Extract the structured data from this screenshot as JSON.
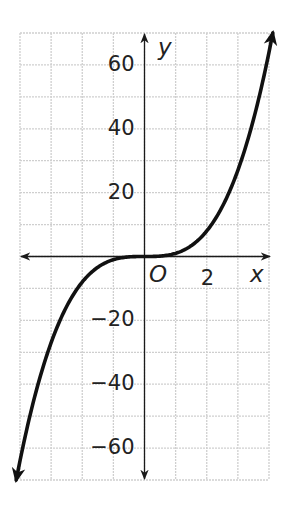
{
  "chart_data": {
    "type": "line",
    "title": "",
    "function": "y = x^3",
    "xlabel": "x",
    "ylabel": "y",
    "origin_label": "O",
    "xlim": [
      -4,
      4
    ],
    "ylim": [
      -70,
      70
    ],
    "x_grid_step": 1,
    "y_grid_step": 10,
    "grid": true,
    "x_tick_labels": [
      {
        "value": 2,
        "label": "2"
      }
    ],
    "y_tick_labels": [
      {
        "value": 60,
        "label": "60"
      },
      {
        "value": 40,
        "label": "40"
      },
      {
        "value": 20,
        "label": "20"
      },
      {
        "value": -20,
        "label": "−20"
      },
      {
        "value": -40,
        "label": "−40"
      },
      {
        "value": -60,
        "label": "−60"
      }
    ],
    "series": [
      {
        "name": "y = x^3",
        "x": [
          -4,
          -3,
          -2,
          -1,
          0,
          1,
          2,
          3,
          4
        ],
        "values": [
          -64,
          -27,
          -8,
          -1,
          0,
          1,
          8,
          27,
          64
        ],
        "arrows_at_ends": true
      }
    ],
    "colors": {
      "curve": "#111111",
      "axis": "#1a1a1a",
      "grid": "#cfcfcf"
    }
  }
}
